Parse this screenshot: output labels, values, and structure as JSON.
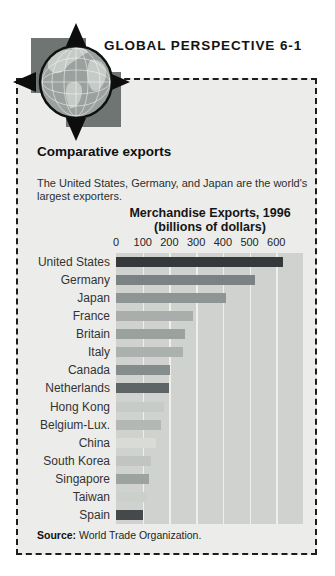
{
  "header": {
    "title": "GLOBAL PERSPECTIVE 6-1"
  },
  "logo": {
    "name": "globe-with-compass-arrows"
  },
  "panel": {
    "heading": "Comparative exports",
    "description": "The United States, Germany, and Japan are the world's largest exporters.",
    "source_label": "Source:",
    "source_text": " World Trade Organization."
  },
  "chart_data": {
    "type": "bar",
    "orientation": "horizontal",
    "title": "Merchandise Exports, 1996",
    "subtitle": "(billions of dollars)",
    "xlabel": "billions of dollars",
    "ylabel": "",
    "xlim": [
      0,
      700
    ],
    "axis_ticks": [
      0,
      100,
      200,
      300,
      400,
      500,
      600
    ],
    "grid": true,
    "legend": false,
    "categories": [
      "United States",
      "Germany",
      "Japan",
      "France",
      "Britain",
      "Italy",
      "Canada",
      "Netherlands",
      "Hong Kong",
      "Belgium-Lux.",
      "China",
      "South Korea",
      "Singapore",
      "Taiwan",
      "Spain"
    ],
    "values": [
      625,
      521,
      411,
      289,
      259,
      251,
      202,
      197,
      181,
      168,
      151,
      130,
      125,
      116,
      102
    ],
    "bar_colors": [
      "#35393b",
      "#7b8283",
      "#8e9594",
      "#a9aeac",
      "#9aa19f",
      "#abb1af",
      "#858c8c",
      "#5e6566",
      "#c6cbc7",
      "#b3b8b5",
      "#d9dbd7",
      "#c1c5c2",
      "#9da3a1",
      "#cbd0cc",
      "#46494b"
    ],
    "source": "World Trade Organization."
  },
  "colors": {
    "page_bg": "#ffffff",
    "panel_bg": "#ecedea",
    "panel_border": "#1d1d1d",
    "plot_bg": "#cfd2ce",
    "gridline": "#eef0ec",
    "logo_square": "#6e7573",
    "globe_ocean": "#9ba19f",
    "globe_land": "#c7cbc7",
    "arrow": "#0d0d0d",
    "text": "#1a1a1a"
  }
}
